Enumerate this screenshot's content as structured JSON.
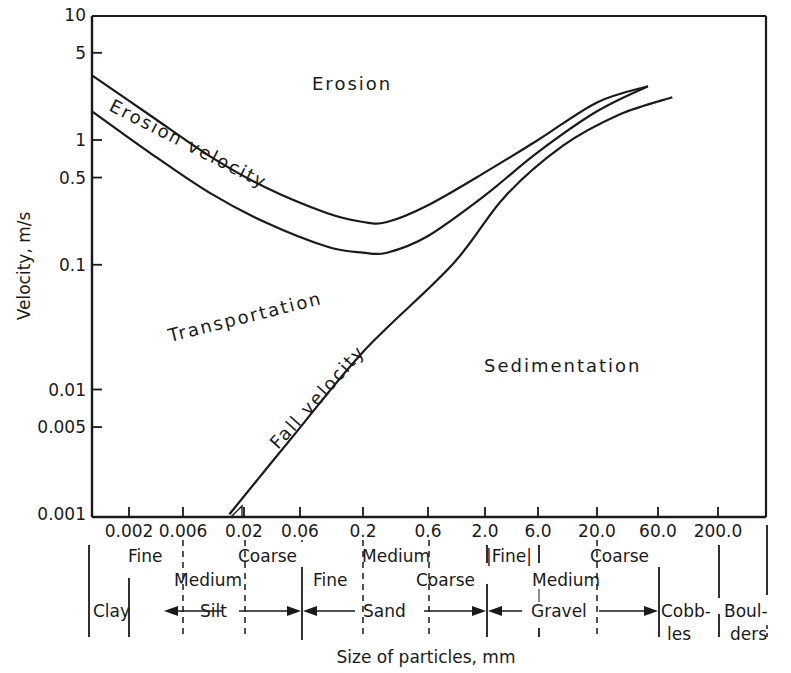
{
  "chart_data": {
    "type": "line",
    "title": "",
    "xlabel": "Size of particles, mm",
    "ylabel": "Velocity, m/s",
    "xscale": "log",
    "yscale": "log",
    "ylim": [
      0.001,
      10
    ],
    "xlim": [
      0.001,
      500
    ],
    "grid": false,
    "legend": "none",
    "x_ticks": [
      {
        "value": 0.002,
        "label": "0.002",
        "px": 129
      },
      {
        "value": 0.006,
        "label": "0.006",
        "px": 183
      },
      {
        "value": 0.02,
        "label": "0.02",
        "px": 244
      },
      {
        "value": 0.06,
        "label": "0.06",
        "px": 300
      },
      {
        "value": 0.2,
        "label": "0.2",
        "px": 363
      },
      {
        "value": 0.6,
        "label": "0.6",
        "px": 428
      },
      {
        "value": 2.0,
        "label": "2.0",
        "px": 485
      },
      {
        "value": 6.0,
        "label": "6.0",
        "px": 538
      },
      {
        "value": 20.0,
        "label": "20.0",
        "px": 597
      },
      {
        "value": 60.0,
        "label": "60.0",
        "px": 658
      },
      {
        "value": 200.0,
        "label": "200.0",
        "px": 718
      }
    ],
    "y_ticks": [
      {
        "value": 10,
        "label": "10"
      },
      {
        "value": 5,
        "label": "5"
      },
      {
        "value": 1,
        "label": "1"
      },
      {
        "value": 0.5,
        "label": "0.5"
      },
      {
        "value": 0.1,
        "label": "0.1"
      },
      {
        "value": 0.01,
        "label": "0.01"
      },
      {
        "value": 0.005,
        "label": "0.005"
      },
      {
        "value": 0.001,
        "label": "0.001"
      }
    ],
    "series": [
      {
        "name": "Erosion velocity (upper bound)",
        "x": [
          0.001,
          0.003,
          0.01,
          0.03,
          0.1,
          0.2,
          0.3,
          0.6,
          2.0,
          6.0,
          20.0,
          50.0
        ],
        "y": [
          3.3,
          1.6,
          0.75,
          0.42,
          0.26,
          0.22,
          0.22,
          0.3,
          0.55,
          1.0,
          2.0,
          2.7
        ]
      },
      {
        "name": "Erosion velocity (lower bound)",
        "x": [
          0.001,
          0.003,
          0.01,
          0.03,
          0.1,
          0.2,
          0.3,
          0.6,
          2.0,
          6.0,
          20.0,
          50.0
        ],
        "y": [
          1.7,
          0.8,
          0.38,
          0.22,
          0.14,
          0.125,
          0.125,
          0.17,
          0.36,
          0.8,
          1.7,
          2.7
        ]
      },
      {
        "name": "Fall velocity",
        "x": [
          0.015,
          0.05,
          0.2,
          1.0,
          3.0,
          10.0,
          30.0,
          80.0
        ],
        "y": [
          0.001,
          0.004,
          0.02,
          0.1,
          0.35,
          0.9,
          1.6,
          2.2
        ]
      }
    ],
    "region_labels": [
      {
        "text": "Erosion",
        "x_px": 312,
        "y_px": 90,
        "rotate": 0
      },
      {
        "text": "Erosion velocity",
        "x_px": 108,
        "y_px": 110,
        "rotate": 27
      },
      {
        "text": "Transportation",
        "x_px": 170,
        "y_px": 342,
        "rotate": -14
      },
      {
        "text": "Fall velocity",
        "x_px": 278,
        "y_px": 450,
        "rotate": -48
      },
      {
        "text": "Sedimentation",
        "x_px": 484,
        "y_px": 372,
        "rotate": 0
      }
    ],
    "classification": {
      "subclasses": [
        {
          "text": "Fine",
          "x_px": 128,
          "row": 1
        },
        {
          "text": "Coarse",
          "x_px": 238,
          "row": 1
        },
        {
          "text": "Medium",
          "x_px": 362,
          "row": 1
        },
        {
          "text": "|Fine|",
          "x_px": 486,
          "row": 1
        },
        {
          "text": "Coarse",
          "x_px": 590,
          "row": 1
        },
        {
          "text": "Medium",
          "x_px": 174,
          "row": 2
        },
        {
          "text": "Fine",
          "x_px": 313,
          "row": 2
        },
        {
          "text": "Coarse",
          "x_px": 416,
          "row": 2
        },
        {
          "text": "Medium",
          "x_px": 532,
          "row": 2
        }
      ],
      "classes": [
        {
          "text": "Clay",
          "x_px": 93
        },
        {
          "text": "Silt",
          "x_px": 200
        },
        {
          "text": "Sand",
          "x_px": 363
        },
        {
          "text": "Gravel",
          "x_px": 531
        },
        {
          "text": "Cobb-",
          "x_px": 661,
          "line2": "les"
        },
        {
          "text": "Boul-",
          "x_px": 724,
          "line2": "ders"
        }
      ]
    }
  }
}
